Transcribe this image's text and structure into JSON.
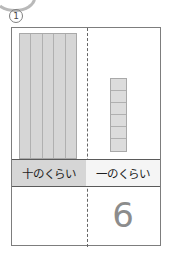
{
  "worksheet": {
    "problem_number": "1",
    "decoration": "partial-circle-arc",
    "place_labels": {
      "tens": "十のくらい",
      "ones": "一のくらい"
    },
    "answers": {
      "tens": "",
      "ones": "6"
    },
    "manipulatives": {
      "tens_rod": {
        "label": "ten-block",
        "strip_count": 5,
        "value": 10
      },
      "ones_column": {
        "label": "unit-cubes",
        "unit_count": 6,
        "value": 6
      }
    },
    "colors": {
      "block_fill": "#d9d9d9",
      "block_border": "#a9a9a9",
      "frame_border": "#7d7d7d",
      "divider": "#666666",
      "label_tens_bg": "#d6d6d6",
      "label_ones_bg": "#f5f5f5",
      "digit_color": "#8c8c8c"
    }
  }
}
